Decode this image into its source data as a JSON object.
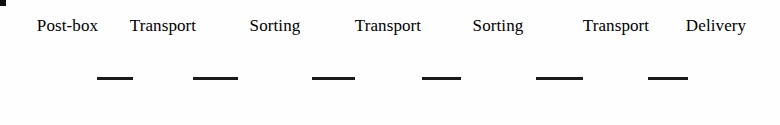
{
  "diagram": {
    "type": "linear-process-flow",
    "background_color": "#fefefe",
    "node_fill_color": "#d4d4d4",
    "node_stroke_color": "#111111",
    "connector_color": "#1a1a1a",
    "label_color": "#000000",
    "nodes": [
      {
        "id": "post-box",
        "label": "Post-box",
        "shape": "circle",
        "x": 36,
        "y": 48,
        "width": 62,
        "height": 60,
        "label_x": 20,
        "label_y": 16,
        "label_width": 95
      },
      {
        "id": "transport-1",
        "label": "Transport",
        "shape": "d-shape",
        "x": 131,
        "y": 47,
        "width": 64,
        "height": 59,
        "label_x": 113,
        "label_y": 16,
        "label_width": 100
      },
      {
        "id": "sorting-1",
        "label": "Sorting",
        "shape": "square",
        "x": 236,
        "y": 38,
        "width": 78,
        "height": 76,
        "label_x": 232,
        "label_y": 16,
        "label_width": 86
      },
      {
        "id": "transport-2",
        "label": "Transport",
        "shape": "d-shape",
        "x": 353,
        "y": 47,
        "width": 71,
        "height": 60,
        "label_x": 338,
        "label_y": 16,
        "label_width": 100
      },
      {
        "id": "sorting-2",
        "label": "Sorting",
        "shape": "square",
        "x": 459,
        "y": 39,
        "width": 79,
        "height": 76,
        "label_x": 455,
        "label_y": 16,
        "label_width": 86
      },
      {
        "id": "transport-3",
        "label": "Transport",
        "shape": "d-shape",
        "x": 581,
        "y": 48,
        "width": 69,
        "height": 60,
        "label_x": 566,
        "label_y": 16,
        "label_width": 100
      },
      {
        "id": "delivery",
        "label": "Delivery",
        "shape": "circle",
        "x": 686,
        "y": 49,
        "width": 59,
        "height": 58,
        "label_x": 671,
        "label_y": 16,
        "label_width": 90
      }
    ],
    "connectors": [
      {
        "id": "post-box-to-transport-1",
        "x": 97,
        "y": 77,
        "width": 36
      },
      {
        "id": "transport-1-to-sorting-1",
        "x": 193,
        "y": 77,
        "width": 45
      },
      {
        "id": "sorting-1-to-transport-2",
        "x": 312,
        "y": 77,
        "width": 43
      },
      {
        "id": "transport-2-to-sorting-2",
        "x": 422,
        "y": 77,
        "width": 39
      },
      {
        "id": "sorting-2-to-transport-3",
        "x": 536,
        "y": 77,
        "width": 47
      },
      {
        "id": "transport-3-to-delivery",
        "x": 648,
        "y": 77,
        "width": 40
      }
    ]
  }
}
